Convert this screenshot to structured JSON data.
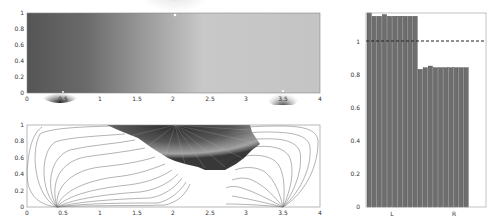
{
  "chart_data": [
    {
      "type": "heatmap",
      "title": "",
      "xlabel": "",
      "ylabel": "",
      "xlim": [
        0,
        4
      ],
      "ylim": [
        0,
        1
      ],
      "xticks": [
        "0",
        "0.5",
        "1",
        "1.5",
        "2",
        "2.5",
        "3",
        "3.5",
        "4"
      ],
      "yticks": [
        "0",
        "0.2",
        "0.4",
        "0.6",
        "0.8",
        "1"
      ],
      "colormap": "grayscale",
      "singular_points": [
        {
          "x": 0.45,
          "y": 0.02,
          "shade": "dark"
        },
        {
          "x": 2.0,
          "y": 0.97,
          "shade": "dark"
        },
        {
          "x": 3.5,
          "y": 0.03,
          "shade": "dark"
        }
      ]
    },
    {
      "type": "line",
      "title": "",
      "description": "streamlines / field lines emanating from sources at x≈0.4 and x≈3.5 on the bottom edge, converging to a shaded region near (2,1)",
      "xlim": [
        0,
        4
      ],
      "ylim": [
        0,
        1
      ],
      "xticks": [
        "0",
        "0.5",
        "1",
        "1.5",
        "2",
        "2.5",
        "3",
        "3.5",
        "4"
      ],
      "yticks": [
        "0",
        "0.2",
        "0.4",
        "0.6",
        "0.8",
        "1"
      ]
    },
    {
      "type": "bar",
      "title": "",
      "categories": [
        "L",
        "R"
      ],
      "series": [
        {
          "name": "L",
          "values": [
            1.17,
            1.15,
            1.15,
            1.16,
            1.15,
            1.15,
            1.15,
            1.15,
            1.15,
            1.15
          ]
        },
        {
          "name": "R",
          "values": [
            0.83,
            0.84,
            0.85,
            0.84,
            0.84,
            0.84,
            0.84,
            0.84,
            0.84,
            0.84
          ]
        }
      ],
      "reference_line": {
        "y": 1,
        "style": "dashed"
      },
      "ylim": [
        0,
        1.17
      ],
      "yticks": [
        "0",
        "0.2",
        "0.4",
        "0.6",
        "0.8",
        "1"
      ],
      "xlabel": "",
      "ylabel": ""
    }
  ],
  "axes": {
    "top": {
      "xticks": [
        "0",
        "0.5",
        "1",
        "1.5",
        "2",
        "2.5",
        "3",
        "3.5",
        "4"
      ],
      "yticks": [
        "0",
        "0.2",
        "0.4",
        "0.6",
        "0.8",
        "1"
      ]
    },
    "bottom": {
      "xticks": [
        "0",
        "0.5",
        "1",
        "1.5",
        "2",
        "2.5",
        "3",
        "3.5",
        "4"
      ],
      "yticks": [
        "0",
        "0.2",
        "0.4",
        "0.6",
        "0.8",
        "1"
      ]
    },
    "bar": {
      "xticks": [
        "L",
        "R"
      ],
      "yticks": [
        "0",
        "0.2",
        "0.4",
        "0.6",
        "0.8",
        "1"
      ]
    }
  }
}
